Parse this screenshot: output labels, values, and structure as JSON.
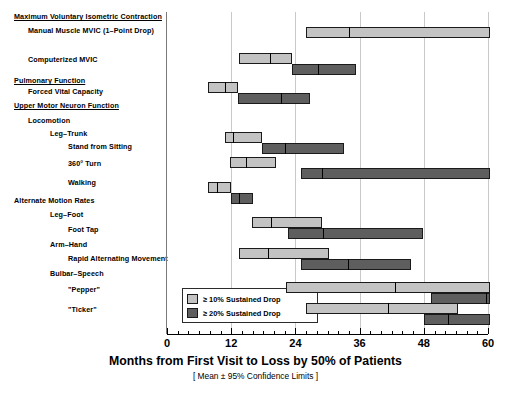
{
  "chart_data": {
    "type": "bar",
    "orientation": "horizontal",
    "title": "",
    "xlabel": "Months from First Visit to Loss by 50% of Patients",
    "xsublabel": "[ Mean ± 95% Confidence Limits ]",
    "ylabel": "",
    "xlim": [
      0,
      60
    ],
    "xticks": [
      0,
      12,
      24,
      36,
      48,
      60
    ],
    "xtick_labels": [
      "0",
      "12",
      "24",
      "36",
      "48",
      "60"
    ],
    "minor_tick_interval": 2,
    "grid": "vertical-at-major-ticks",
    "legend_position": "inside-bottom-left",
    "series": [
      {
        "name": "≥ 10% Sustained Drop",
        "color": "#c3c3c3"
      },
      {
        "name": "≥ 20% Sustained Drop",
        "color": "#5e5e5e"
      }
    ],
    "categories": [
      "Manual Muscle MVIC (1–Point Drop)",
      "Computerized MVIC",
      "Forced Vital Capacity",
      "Stand from Sitting",
      "360° Turn",
      "Walking",
      "Foot Tap",
      "Rapid Alternating Movement",
      "\"Pepper\"",
      "\"Ticker\""
    ],
    "measures": [
      {
        "label": "Manual Muscle MVIC (1–Point Drop)",
        "drop10": {
          "mean": 34.0,
          "low": 26.0,
          "high": 61.0,
          "clipped_high": true
        },
        "drop20": null
      },
      {
        "label": "Computerized MVIC",
        "drop10": {
          "mean": 19.3,
          "low": 13.5,
          "high": 23.3
        },
        "drop20": {
          "mean": 28.3,
          "low": 23.3,
          "high": 35.4
        }
      },
      {
        "label": "Forced Vital Capacity",
        "drop10": {
          "mean": 10.9,
          "low": 7.7,
          "high": 13.3
        },
        "drop20": {
          "mean": 21.4,
          "low": 13.3,
          "high": 26.8
        }
      },
      {
        "label": "Stand from Sitting",
        "drop10": {
          "mean": 12.4,
          "low": 10.9,
          "high": 17.8
        },
        "drop20": {
          "mean": 22.0,
          "low": 17.8,
          "high": 33.0
        }
      },
      {
        "label": "360° Turn",
        "drop10": {
          "mean": 14.8,
          "low": 11.8,
          "high": 20.3
        },
        "drop20": {
          "mean": 28.9,
          "low": 25.0,
          "high": 60.6,
          "clipped_high": true
        }
      },
      {
        "label": "Walking",
        "drop10": {
          "mean": 9.4,
          "low": 7.7,
          "high": 12.0
        },
        "drop20": {
          "mean": 13.5,
          "low": 12.0,
          "high": 16.1
        }
      },
      {
        "label": "Foot Tap",
        "drop10": {
          "mean": 19.5,
          "low": 15.9,
          "high": 28.9
        },
        "drop20": {
          "mean": 29.1,
          "low": 22.7,
          "high": 47.8
        }
      },
      {
        "label": "Rapid Alternating Movement",
        "drop10": {
          "mean": 18.9,
          "low": 13.5,
          "high": 30.2
        },
        "drop20": {
          "mean": 33.9,
          "low": 25.0,
          "high": 45.6
        }
      },
      {
        "label": "\"Pepper\"",
        "drop10": {
          "mean": 42.6,
          "low": 22.3,
          "high": 60.6,
          "clipped_high": true
        },
        "drop20": {
          "mean": 59.6,
          "low": 49.3,
          "high": 60.6,
          "clipped_high": true
        }
      },
      {
        "label": "\"Ticker\"",
        "drop10": {
          "mean": 41.3,
          "low": 25.9,
          "high": 54.4
        },
        "drop20": {
          "mean": 52.5,
          "low": 48.0,
          "high": 60.6,
          "clipped_high": true
        }
      }
    ]
  },
  "row_labels": [
    {
      "text": "Maximum Voluntary Isometric Contraction",
      "indent": 0,
      "style": "category"
    },
    {
      "text": "Manual Muscle MVIC (1–Point Drop)",
      "indent": 1,
      "style": "item"
    },
    {
      "text": "Computerized MVIC",
      "indent": 1,
      "style": "item"
    },
    {
      "text": "Pulmonary Function",
      "indent": 0,
      "style": "category"
    },
    {
      "text": "Forced Vital Capacity",
      "indent": 1,
      "style": "item"
    },
    {
      "text": "Upper Motor Neuron Function",
      "indent": 0,
      "style": "category"
    },
    {
      "text": "Locomotion",
      "indent": 1,
      "style": "group"
    },
    {
      "text": "Leg–Trunk",
      "indent": 2,
      "style": "group"
    },
    {
      "text": "Stand from Sitting",
      "indent": 3,
      "style": "item"
    },
    {
      "text": "360° Turn",
      "indent": 3,
      "style": "item"
    },
    {
      "text": "Walking",
      "indent": 3,
      "style": "item"
    },
    {
      "text": "Alternate Motion Rates",
      "indent": 0,
      "style": "group"
    },
    {
      "text": "Leg–Foot",
      "indent": 2,
      "style": "group"
    },
    {
      "text": "Foot Tap",
      "indent": 3,
      "style": "item"
    },
    {
      "text": "Arm–Hand",
      "indent": 2,
      "style": "group"
    },
    {
      "text": "Rapid Alternating Movement",
      "indent": 3,
      "style": "item"
    },
    {
      "text": "Bulbar–Speech",
      "indent": 2,
      "style": "group"
    },
    {
      "text": "\"Pepper\"",
      "indent": 3,
      "style": "item"
    },
    {
      "text": "\"Ticker\"",
      "indent": 3,
      "style": "item"
    }
  ],
  "legend": {
    "items": [
      {
        "label": "≥ 10% Sustained Drop",
        "color": "#c3c3c3"
      },
      {
        "label": "≥ 20% Sustained Drop",
        "color": "#5e5e5e"
      }
    ]
  },
  "axis": {
    "xlabel": "Months from First Visit to Loss by 50% of Patients",
    "xsublabel": "[ Mean ± 95% Confidence Limits ]",
    "ticks": [
      "0",
      "12",
      "24",
      "36",
      "48",
      "60"
    ]
  },
  "colors": {
    "light": "#c3c3c3",
    "dark": "#5e5e5e",
    "outline": "#1a1a1a",
    "grid": "#c9c9c9"
  }
}
